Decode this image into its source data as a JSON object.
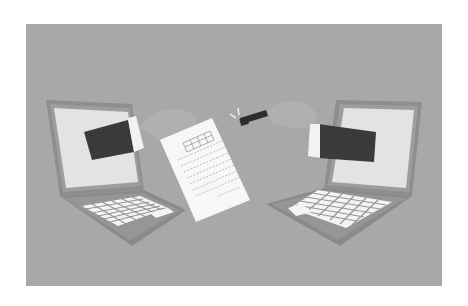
{
  "illustration": {
    "subject": "file transfer between two laptops",
    "colors": {
      "page_background": "#ffffff",
      "panel_background": "#a8a8a8",
      "laptop_body": "#8f8f8f",
      "laptop_bezel": "#9a9a9a",
      "screen": "#e2e2e2",
      "keys": "#f4f4f4",
      "sleeve": "#3a3a3a",
      "cuff": "#f2f2f2",
      "hand_ghost": "#b4b4b4",
      "document": "#f7f7f7",
      "usb_drive": "#2e2e2e"
    },
    "elements": [
      "left-laptop",
      "left-arm-sleeve",
      "document-sheet",
      "usb-flash-drive",
      "right-laptop",
      "right-arm-sleeve"
    ]
  }
}
